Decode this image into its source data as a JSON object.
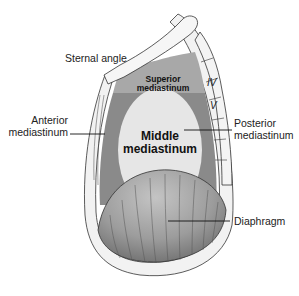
{
  "diagram": {
    "labels": {
      "sternal_angle": "Sternal angle",
      "anterior_line1": "Anterior",
      "anterior_line2": "mediastinum",
      "posterior_line1": "Posterior",
      "posterior_line2": "mediastinum",
      "diaphragm": "Diaphragm"
    },
    "regions": {
      "superior_line1": "Superior",
      "superior_line2": "mediastinum",
      "middle_line1": "Middle",
      "middle_line2": "mediastinum"
    },
    "vertebrae": {
      "iv": "IV",
      "v": "V"
    },
    "colors": {
      "superior": "#a8a8a8",
      "anterior_posterior": "#8a8a8a",
      "middle": "#e6e6e6",
      "diaphragm": "#9a9a9a",
      "bone": "#f4f4f4",
      "outline": "#333333"
    }
  }
}
